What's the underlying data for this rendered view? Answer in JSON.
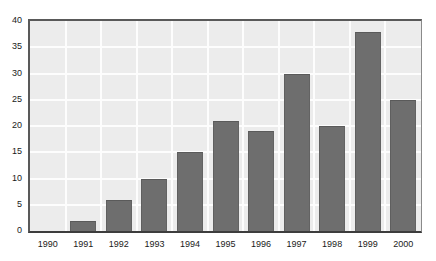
{
  "chart_data": {
    "type": "bar",
    "title": "",
    "subtitle": "",
    "xlabel": "",
    "ylabel": "",
    "categories": [
      "1990",
      "1991",
      "1992",
      "1993",
      "1994",
      "1995",
      "1996",
      "1997",
      "1998",
      "1999",
      "2000"
    ],
    "values": [
      0,
      2,
      6,
      10,
      15,
      21,
      19,
      30,
      20,
      38,
      25
    ],
    "series": [
      {
        "name": "",
        "values": [
          0,
          2,
          6,
          10,
          15,
          21,
          19,
          30,
          20,
          38,
          25
        ]
      }
    ],
    "ylim": [
      0,
      40
    ],
    "ytick_values": [
      0,
      5,
      10,
      15,
      20,
      25,
      30,
      35,
      40
    ],
    "ytick_labels": [
      "0",
      "5",
      "10",
      "15",
      "20",
      "25",
      "30",
      "35",
      "40"
    ],
    "xtick_labels": [
      "1990",
      "1991",
      "1992",
      "1993",
      "1994",
      "1995",
      "1996",
      "1997",
      "1998",
      "1999",
      "2000"
    ],
    "grid": {
      "horizontal": true,
      "vertical": true,
      "color": "#fdfdfd"
    },
    "legend": {
      "visible": false,
      "position": "none",
      "entries": []
    },
    "annotations": [],
    "colors": {
      "bar_fill": "#6e6e6e",
      "bar_edge": "#5a5a5a",
      "plot_background": "#ececec",
      "page_background": "#ffffff",
      "axis_line": "#595959",
      "tick_label": "#1a1a1a",
      "gridline": "#fdfdfd"
    }
  }
}
